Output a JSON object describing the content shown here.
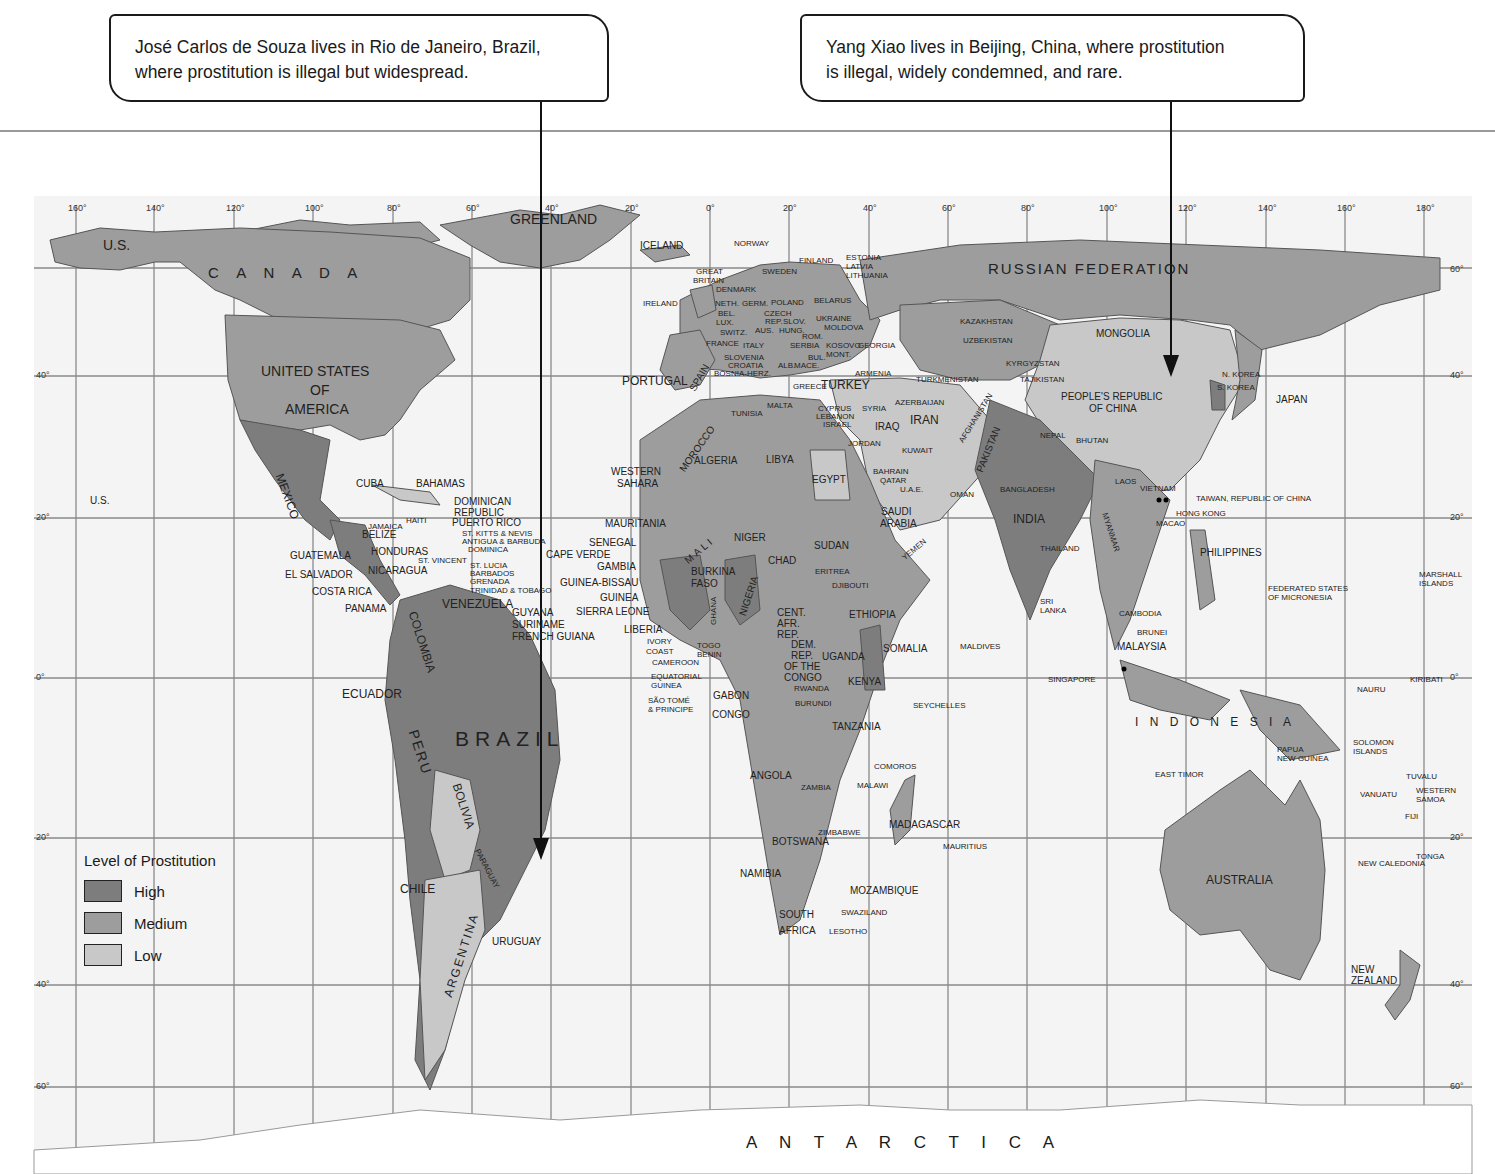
{
  "callouts": [
    {
      "line1": "José Carlos de Souza lives in Rio de Janeiro, Brazil,",
      "line2": "where prostitution is illegal but widespread."
    },
    {
      "line1": "Yang Xiao lives in Beijing, China, where prostitution",
      "line2": "is illegal, widely condemned, and rare."
    }
  ],
  "legend": {
    "title": "Level of Prostitution",
    "items": [
      {
        "label": "High",
        "color": "#7d7d7d"
      },
      {
        "label": "Medium",
        "color": "#9d9d9d"
      },
      {
        "label": "Low",
        "color": "#c8c8c8"
      }
    ]
  },
  "colors": {
    "high": "#7d7d7d",
    "medium": "#9d9d9d",
    "low": "#c8c8c8",
    "ocean": "#f4f4f4",
    "grid": "#8a8a8a"
  },
  "axes": {
    "longitude_ticks": [
      "160°",
      "140°",
      "120°",
      "100°",
      "80°",
      "60°",
      "40°",
      "20°",
      "0°",
      "20°",
      "40°",
      "60°",
      "80°",
      "100°",
      "120°",
      "140°",
      "160°",
      "180°"
    ],
    "latitude_ticks_left": [
      "40°",
      "20°",
      "0°",
      "20°",
      "40°",
      "60°"
    ],
    "latitude_ticks_right": [
      "60°",
      "40°",
      "20°",
      "0°",
      "20°",
      "40°",
      "60°"
    ]
  },
  "labels": {
    "greenland": "GREENLAND",
    "iceland": "ICELAND",
    "us_alaska": "U.S.",
    "canada": "C A N A D A",
    "usa1": "UNITED STATES",
    "usa2": "OF",
    "usa3": "AMERICA",
    "us_hawaii": "U.S.",
    "mexico": "MEXICO",
    "cuba": "CUBA",
    "bahamas": "BAHAMAS",
    "dominican1": "DOMINICAN",
    "dominican2": "REPUBLIC",
    "haiti": "HAITI",
    "jamaica": "JAMAICA",
    "puerto_rico": "PUERTO RICO",
    "st_kitts": "ST. KITTS & NEVIS",
    "antigua": "ANTIGUA & BARBUDA",
    "dominica": "DOMINICA",
    "belize": "BELIZE",
    "guatemala": "GUATEMALA",
    "honduras": "HONDURAS",
    "el_salvador": "EL SALVADOR",
    "nicaragua": "NICARAGUA",
    "st_vincent": "ST. VINCENT",
    "st_lucia": "ST. LUCIA",
    "barbados": "BARBADOS",
    "grenada": "GRENADA",
    "trinidad": "TRINIDAD & TOBAGO",
    "costa_rica": "COSTA RICA",
    "panama": "PANAMA",
    "venezuela": "VENEZUELA",
    "guyana": "GUYANA",
    "suriname": "SURINAME",
    "french_guiana": "FRENCH GUIANA",
    "colombia": "COLOMBIA",
    "ecuador": "ECUADOR",
    "peru": "PERU",
    "brazil": "BRAZIL",
    "bolivia": "BOLIVIA",
    "paraguay": "PARAGUAY",
    "chile": "CHILE",
    "argentina": "ARGENTINA",
    "uruguay": "URUGUAY",
    "norway": "NORWAY",
    "sweden": "SWEDEN",
    "finland": "FINLAND",
    "estonia": "ESTONIA",
    "latvia": "LATVIA",
    "lithuania": "LITHUANIA",
    "great_britain1": "GREAT",
    "great_britain2": "BRITAIN",
    "denmark": "DENMARK",
    "ireland": "IRELAND",
    "neth": "NETH.",
    "bel": "BEL.",
    "lux": "LUX.",
    "switz": "SWITZ.",
    "germ": "GERM.",
    "poland": "POLAND",
    "belarus": "BELARUS",
    "czech1": "CZECH",
    "czech2": "REP.",
    "slov": "SLOV.",
    "aus": "AUS.",
    "hung": "HUNG.",
    "ukraine": "UKRAINE",
    "moldova": "MOLDOVA",
    "france": "FRANCE",
    "italy": "ITALY",
    "rom": "ROM.",
    "serbia": "SERBIA",
    "kosovo": "KOSOVO",
    "georgia": "GEORGIA",
    "slovenia": "SLOVENIA",
    "croatia": "CROATIA",
    "bosnia": "BOSNIA-HERZ.",
    "bul": "BUL.",
    "mont": "MONT.",
    "alb": "ALB.",
    "mace": "MACE.",
    "portugal": "PORTUGAL",
    "spain": "SPAIN",
    "greece": "GREECE",
    "turkey": "TURKEY",
    "armenia": "ARMENIA",
    "malta": "MALTA",
    "cyprus": "CYPRUS",
    "lebanon": "LEBANON",
    "israel": "ISRAEL",
    "syria": "SYRIA",
    "iraq": "IRAQ",
    "jordan": "JORDAN",
    "kuwait": "KUWAIT",
    "azerbaijan": "AZERBAIJAN",
    "iran": "IRAN",
    "tunisia": "TUNISIA",
    "morocco": "MOROCCO",
    "algeria": "ALGERIA",
    "libya": "LIBYA",
    "egypt": "EGYPT",
    "western_sahara1": "WESTERN",
    "western_sahara2": "SAHARA",
    "mauritania": "MAURITANIA",
    "mali": "MALI",
    "niger": "NIGER",
    "senegal": "SENEGAL",
    "cape_verde": "CAPE VERDE",
    "gambia": "GAMBIA",
    "guinea_bissau": "GUINEA-BISSAU",
    "guinea": "GUINEA",
    "sierra_leone": "SIERRA LEONE",
    "liberia": "LIBERIA",
    "ivory1": "IVORY",
    "ivory2": "COAST",
    "burkina1": "BURKINA",
    "burkina2": "FASO",
    "ghana": "GHANA",
    "togo": "TOGO",
    "benin": "BENIN",
    "nigeria": "NIGERIA",
    "chad": "CHAD",
    "sudan": "SUDAN",
    "eritrea": "ERITREA",
    "djibouti": "DJIBOUTI",
    "ethiopia": "ETHIOPIA",
    "somalia": "SOMALIA",
    "car1": "CENT.",
    "car2": "AFR.",
    "car3": "REP.",
    "cameroon": "CAMEROON",
    "eq_guinea1": "EQUATORIAL",
    "eq_guinea2": "GUINEA",
    "sao_tome1": "SÃO TOMÉ",
    "sao_tome2": "& PRINCIPE",
    "gabon": "GABON",
    "congo": "CONGO",
    "drc1": "DEM.",
    "drc2": "REP.",
    "drc3": "OF THE",
    "drc4": "CONGO",
    "uganda": "UGANDA",
    "kenya": "KENYA",
    "rwanda": "RWANDA",
    "burundi": "BURUNDI",
    "tanzania": "TANZANIA",
    "angola": "ANGOLA",
    "zambia": "ZAMBIA",
    "malawi": "MALAWI",
    "comoros": "COMOROS",
    "seychelles": "SEYCHELLES",
    "zimbabwe": "ZIMBABWE",
    "botswana": "BOTSWANA",
    "namibia": "NAMIBIA",
    "madagascar": "MADAGASCAR",
    "mauritius": "MAURITIUS",
    "mozambique": "MOZAMBIQUE",
    "swaziland": "SWAZILAND",
    "south_africa1": "SOUTH",
    "south_africa2": "AFRICA",
    "lesotho": "LESOTHO",
    "saudi1": "SAUDI",
    "saudi2": "ARABIA",
    "bahrain": "BAHRAIN",
    "qatar": "QATAR",
    "uae": "U.A.E.",
    "oman": "OMAN",
    "yemen": "YEMEN",
    "russia": "RUSSIAN   FEDERATION",
    "kazakhstan": "KAZAKHSTAN",
    "uzbekistan": "UZBEKISTAN",
    "turkmenistan": "TURKMENISTAN",
    "kyrgyzstan": "KYRGYZSTAN",
    "tajikistan": "TAJIKISTAN",
    "afghanistan": "AFGHANISTAN",
    "pakistan": "PAKISTAN",
    "mongolia": "MONGOLIA",
    "china1": "PEOPLE'S REPUBLIC",
    "china2": "OF CHINA",
    "nepal": "NEPAL",
    "bhutan": "BHUTAN",
    "bangladesh": "BANGLADESH",
    "india": "INDIA",
    "myanmar": "MYANMAR",
    "n_korea": "N. KOREA",
    "s_korea": "S. KOREA",
    "japan": "JAPAN",
    "laos": "LAOS",
    "vietnam": "VIETNAM",
    "taiwan": "TAIWAN, REPUBLIC OF CHINA",
    "hong_kong": "HONG KONG",
    "macao": "MACAO",
    "thailand": "THAILAND",
    "philippines": "PHILIPPINES",
    "sri_lanka1": "SRI",
    "sri_lanka2": "LANKA",
    "cambodia": "CAMBODIA",
    "maldives": "MALDIVES",
    "brunei": "BRUNEI",
    "malaysia": "MALAYSIA",
    "singapore": "SINGAPORE",
    "micronesia1": "FEDERATED STATES",
    "micronesia2": "OF MICRONESIA",
    "marshall1": "MARSHALL",
    "marshall2": "ISLANDS",
    "nauru": "NAURU",
    "kiribati": "KIRIBATI",
    "indonesia": "I N D O N E S I A",
    "east_timor": "EAST TIMOR",
    "png1": "PAPUA",
    "png2": "NEW GUINEA",
    "solomon1": "SOLOMON",
    "solomon2": "ISLANDS",
    "tuvalu": "TUVALU",
    "vanuatu": "VANUATU",
    "samoa1": "WESTERN",
    "samoa2": "SAMOA",
    "fiji": "FIJI",
    "tonga": "TONGA",
    "new_caledonia": "NEW CALEDONIA",
    "australia": "AUSTRALIA",
    "nz1": "NEW",
    "nz2": "ZEALAND",
    "antarctica": "A N T A R C T I C A"
  }
}
